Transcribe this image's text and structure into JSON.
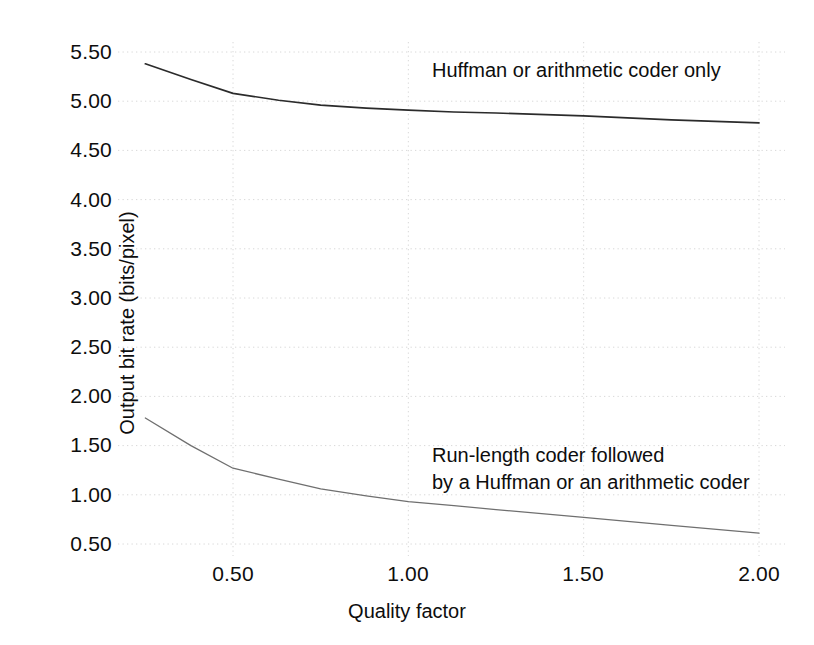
{
  "chart_data": {
    "type": "line",
    "title": "",
    "xlabel": "Quality factor",
    "ylabel": "Output bit rate (bits/pixel)",
    "xlim": [
      0.25,
      2.0
    ],
    "ylim": [
      0.4,
      5.65
    ],
    "grid": true,
    "grid_style": "dotted",
    "legend_position": "inline-annotations",
    "xticks": [
      "0.50",
      "1.00",
      "1.50",
      "2.00"
    ],
    "xtick_values": [
      0.5,
      1.0,
      1.5,
      2.0
    ],
    "yticks": [
      "5.50",
      "5.00",
      "4.50",
      "4.00",
      "3.50",
      "3.00",
      "2.50",
      "2.00",
      "1.50",
      "1.00",
      "0.50"
    ],
    "ytick_values": [
      5.5,
      5.0,
      4.5,
      4.0,
      3.5,
      3.0,
      2.5,
      2.0,
      1.5,
      1.0,
      0.5
    ],
    "series": [
      {
        "name": "Huffman or arithmetic coder only",
        "color": "#2b2b2b",
        "x": [
          0.25,
          0.38,
          0.5,
          0.63,
          0.75,
          0.88,
          1.0,
          1.13,
          1.25,
          1.5,
          1.75,
          2.0
        ],
        "values": [
          5.38,
          5.22,
          5.08,
          5.01,
          4.96,
          4.93,
          4.91,
          4.89,
          4.88,
          4.85,
          4.81,
          4.78
        ]
      },
      {
        "name": "Run-length coder followed by a Huffman or an arithmetic coder",
        "color": "#6f6f6f",
        "x": [
          0.25,
          0.38,
          0.5,
          0.63,
          0.75,
          0.88,
          1.0,
          1.13,
          1.25,
          1.5,
          1.75,
          2.0
        ],
        "values": [
          1.78,
          1.5,
          1.27,
          1.16,
          1.06,
          0.99,
          0.93,
          0.89,
          0.85,
          0.77,
          0.69,
          0.61
        ]
      }
    ],
    "annotations": [
      {
        "id": "upper",
        "text": "Huffman or arithmetic coder only",
        "x": 1.06,
        "y": 5.33
      },
      {
        "id": "lower",
        "text": "Run-length coder followed\nby a Huffman or an arithmetic coder",
        "x": 1.06,
        "y": 1.42
      }
    ],
    "colors": {
      "background": "#ffffff",
      "gridline": "#d8d8d8",
      "text": "#0d0d0d",
      "series_upper": "#2b2b2b",
      "series_lower": "#6f6f6f"
    }
  },
  "axes": {
    "y_ticks": [
      {
        "label": "5.50",
        "top": 52
      },
      {
        "label": "5.00",
        "top": 101
      },
      {
        "label": "4.50",
        "top": 150
      },
      {
        "label": "4.00",
        "top": 200
      },
      {
        "label": "3.50",
        "top": 249
      },
      {
        "label": "3.00",
        "top": 298
      },
      {
        "label": "2.50",
        "top": 347
      },
      {
        "label": "2.00",
        "top": 396
      },
      {
        "label": "1.50",
        "top": 445
      },
      {
        "label": "1.00",
        "top": 495
      },
      {
        "label": "0.50",
        "top": 544
      }
    ],
    "x_ticks": [
      {
        "label": "0.50",
        "left": 233
      },
      {
        "label": "1.00",
        "left": 408
      },
      {
        "label": "1.50",
        "left": 583
      },
      {
        "label": "2.00",
        "left": 759
      }
    ],
    "x_axis_title": "Quality factor",
    "y_axis_title": "Output bit rate (bits/pixel)"
  },
  "annotations": {
    "upper": "Huffman or arithmetic coder only",
    "lower": "Run-length coder followed\nby a Huffman or an arithmetic coder"
  }
}
